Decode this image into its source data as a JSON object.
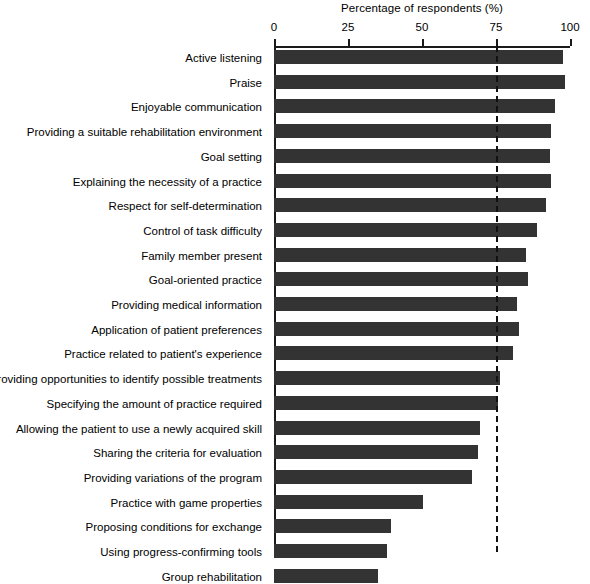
{
  "chart_data": {
    "type": "bar",
    "orientation": "horizontal",
    "title": "Percentage of respondents (%)",
    "xlabel": "Percentage of respondents (%)",
    "ylabel": "",
    "xlim": [
      0,
      100
    ],
    "grid": false,
    "legend": null,
    "bar_color": "#333333",
    "axis_color": "#1a1a1a",
    "tick_labels": [
      "0",
      "25",
      "50",
      "75",
      "100"
    ],
    "ticks": [
      0,
      25,
      50,
      75,
      100
    ],
    "threshold": {
      "value": 75,
      "style": "dashed",
      "color": "#111111",
      "label": ""
    },
    "categories": [
      "Active listening",
      "Praise",
      "Enjoyable communication",
      "Providing a suitable rehabilitation environment",
      "Goal setting",
      "Explaining the necessity of a practice",
      "Respect for self-determination",
      "Control of task difficulty",
      "Family member present",
      "Goal-oriented practice",
      "Providing medical information",
      "Application of patient preferences",
      "Practice related to patient's experience",
      "Providing opportunities to identify possible treatments",
      "Specifying the amount of practice required",
      "Allowing the patient to use a newly acquired skill",
      "Sharing the criteria for evaluation",
      "Providing variations of the program",
      "Practice with game properties",
      "Proposing conditions for exchange",
      "Using progress-confirming tools",
      "Group rehabilitation"
    ],
    "values": [
      97.6,
      98.3,
      94.9,
      93.6,
      93.2,
      93.6,
      91.9,
      88.8,
      85.1,
      85.8,
      82.1,
      82.8,
      80.7,
      76.4,
      75.7,
      69.6,
      68.9,
      66.9,
      50.3,
      39.5,
      38.2,
      35.1
    ]
  },
  "caption": {
    "bottom_sliver": "",
    "visible": false
  }
}
